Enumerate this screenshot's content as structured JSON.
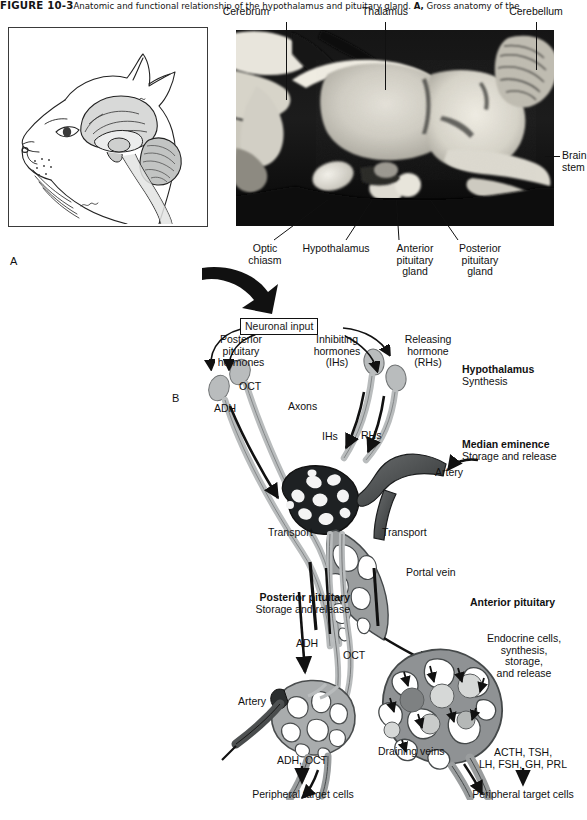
{
  "figure": {
    "number": "FIGURE 10-3",
    "caption_text": "Anatomic and functional relationship of the hypothalamus and pituitary gland. ",
    "caption_panel_a": "A,",
    "caption_tail": " Gross anatomy of the"
  },
  "panel_a": {
    "letter": "A",
    "illustration_name": "cat-head-sagittal-brain-line-drawing"
  },
  "panel_photo": {
    "name": "midsagittal-brain-gross-photograph",
    "labels_top": [
      {
        "text": "Cerebrum",
        "x": 246,
        "y": 8
      },
      {
        "text": "Thalamus",
        "x": 355,
        "y": 8
      },
      {
        "text": "Cerebellum",
        "x": 495,
        "y": 8
      }
    ],
    "labels_right": [
      {
        "line1": "Brain",
        "line2": "stem"
      }
    ],
    "labels_bottom": [
      {
        "line1": "Optic",
        "line2": "chiasm",
        "line3": ""
      },
      {
        "line1": "Hypothalamus",
        "line2": "",
        "line3": ""
      },
      {
        "line1": "Anterior",
        "line2": "pituitary",
        "line3": "gland"
      },
      {
        "line1": "Posterior",
        "line2": "pituitary",
        "line3": "gland"
      }
    ]
  },
  "panel_b": {
    "letter": "B",
    "neuronal_input": "Neuronal input",
    "hormone_groups": [
      {
        "line1": "Posterior",
        "line2": "pituitary",
        "line3": "hormones"
      },
      {
        "line1": "Inhibiting",
        "line2": "hormones",
        "line3": "(IHs)"
      },
      {
        "line1": "Releasing",
        "line2": "hormone",
        "line3": "(RHs)"
      }
    ],
    "inline_labels": {
      "oct_top": "OCT",
      "adh_top": "ADH",
      "axons": "Axons",
      "ihs": "IHs",
      "rhs": "RHs",
      "artery_top": "Artery",
      "transport_left": "Transport",
      "transport_right": "Transport",
      "portal_vein": "Portal vein",
      "adh_mid": "ADH",
      "oct_mid": "OCT",
      "artery_bottom": "Artery",
      "draining_veins": "Draining veins"
    },
    "region_callouts": [
      {
        "title": "Hypothalamus",
        "subtitle": "Synthesis"
      },
      {
        "title": "Median eminence",
        "subtitle": "Storage and release"
      },
      {
        "title": "Posterior pituitary",
        "subtitle": "Storage and release"
      },
      {
        "title": "Anterior pituitary",
        "subtitle": ""
      }
    ],
    "anterior_detail": {
      "line1": "Endocrine cells,",
      "line2": "synthesis,",
      "line3": "storage,",
      "line4": "and release"
    },
    "outputs": [
      {
        "hormones_line1": "ADH, OCT",
        "hormones_line2": "",
        "target": "Peripheral target cells"
      },
      {
        "hormones_line1": "ACTH, TSH,",
        "hormones_line2": "LH, FSH, GH, PRL",
        "target": "Peripheral target cells"
      }
    ]
  },
  "colors": {
    "ink": "#111111",
    "neuron_gray": "#b9bcbd",
    "vessel_light": "#a8abac",
    "vessel_mid": "#8d9192",
    "vessel_dark": "#4a4d4e",
    "capillary_dark": "#222426",
    "cell_light": "#d3d5d4",
    "cell_dark": "#8b8e8d",
    "box_border": "#111111",
    "panel_border": "#3a3a3a"
  }
}
